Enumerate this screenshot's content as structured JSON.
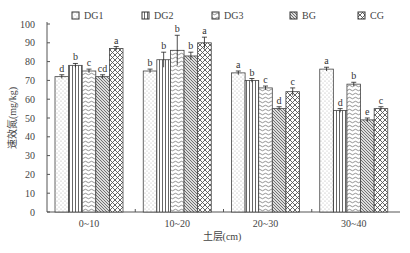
{
  "chart_data": {
    "type": "bar",
    "title": "",
    "xlabel": "土层(cm)",
    "ylabel": "速效氮(mg/kg)",
    "ylim": [
      0,
      100
    ],
    "yticks": [
      0,
      10,
      20,
      30,
      40,
      50,
      60,
      70,
      80,
      90,
      100
    ],
    "grid": false,
    "legend_position": "top",
    "categories": [
      "0~10",
      "10~20",
      "20~30",
      "30~40"
    ],
    "series": [
      {
        "name": "DG1",
        "pattern": "dots",
        "values": [
          72,
          75,
          74,
          76
        ],
        "errors": [
          1,
          1,
          1,
          1
        ],
        "letters": [
          "d",
          "b",
          "a",
          "a"
        ]
      },
      {
        "name": "DG2",
        "pattern": "vlines",
        "values": [
          78,
          81,
          70,
          54
        ],
        "errors": [
          1,
          4,
          1,
          1
        ],
        "letters": [
          "b",
          "b",
          "b",
          "d"
        ]
      },
      {
        "name": "DG3",
        "pattern": "waves",
        "values": [
          75,
          86,
          66,
          68
        ],
        "errors": [
          1,
          8,
          1,
          1
        ],
        "letters": [
          "c",
          "b",
          "c",
          "b"
        ]
      },
      {
        "name": "BG",
        "pattern": "diag",
        "values": [
          72,
          83,
          55,
          49
        ],
        "errors": [
          1,
          2,
          1,
          1
        ],
        "letters": [
          "cd",
          "b",
          "d",
          "e"
        ]
      },
      {
        "name": "CG",
        "pattern": "checker",
        "values": [
          87,
          90,
          64,
          55
        ],
        "errors": [
          1,
          3,
          2,
          1
        ],
        "letters": [
          "a",
          "a",
          "c",
          "c"
        ]
      }
    ]
  },
  "colors": {
    "axis": "#555555",
    "bar_stroke": "#444444",
    "pattern_ink": "#777777",
    "background": "#ffffff"
  }
}
